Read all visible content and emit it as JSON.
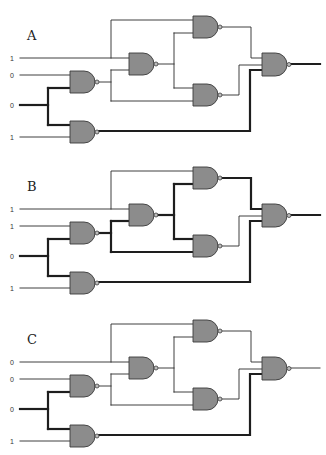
{
  "diagram": {
    "gate_type": "NAND",
    "gate_fill": "#8c8c8c",
    "wire_color": "#2a2a2a",
    "circuits": [
      {
        "label": "A",
        "inputs": [
          "1",
          "0",
          "0",
          "1"
        ],
        "thick_wires": [
          "in_c",
          "bus_c",
          "g2_out",
          "g6_out"
        ]
      },
      {
        "label": "B",
        "inputs": [
          "1",
          "1",
          "0",
          "1"
        ],
        "thick_wires": [
          "in_c",
          "bus_c",
          "g1_out",
          "g3_out",
          "g4_out",
          "g2_out",
          "g6_out"
        ]
      },
      {
        "label": "C",
        "inputs": [
          "0",
          "0",
          "0",
          "1"
        ],
        "thick_wires": [
          "in_c",
          "bus_c",
          "g2_out"
        ]
      }
    ]
  }
}
